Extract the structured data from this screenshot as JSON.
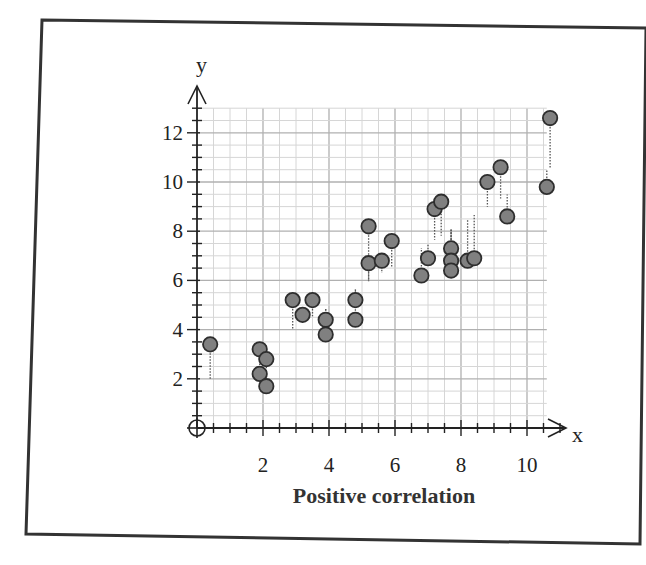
{
  "figure": {
    "caption": "Positive correlation",
    "x_axis_name": "x",
    "y_axis_name": "y"
  },
  "colors": {
    "frame": "#333333",
    "grid_minor": "#d6d6d6",
    "grid_major": "#b0b0b0",
    "axis": "#222222",
    "point_fill": "#808080",
    "point_stroke": "#2e2e2e",
    "residual": "#555555"
  },
  "chart_data": {
    "type": "scatter",
    "title": "Positive correlation",
    "xlabel": "x",
    "ylabel": "y",
    "xlim": [
      0,
      11
    ],
    "ylim": [
      0,
      13
    ],
    "x_ticks": [
      2,
      4,
      6,
      8,
      10
    ],
    "y_ticks": [
      2,
      4,
      6,
      8,
      10,
      12
    ],
    "grid": true,
    "minor_grid_step": 0.5,
    "major_grid_step": 2,
    "legend": null,
    "trend_line": {
      "intercept": 1.6,
      "slope": 0.84,
      "drawn": false,
      "residuals_shown_as_dotted_lines": true
    },
    "points": [
      {
        "x": 0.4,
        "y": 3.4
      },
      {
        "x": 1.9,
        "y": 3.2
      },
      {
        "x": 2.1,
        "y": 2.8
      },
      {
        "x": 1.9,
        "y": 2.2
      },
      {
        "x": 2.1,
        "y": 1.7
      },
      {
        "x": 2.9,
        "y": 5.2
      },
      {
        "x": 3.2,
        "y": 4.6
      },
      {
        "x": 3.5,
        "y": 5.2
      },
      {
        "x": 3.9,
        "y": 4.4
      },
      {
        "x": 3.9,
        "y": 3.8
      },
      {
        "x": 4.8,
        "y": 5.2
      },
      {
        "x": 4.8,
        "y": 4.4
      },
      {
        "x": 5.2,
        "y": 8.2
      },
      {
        "x": 5.2,
        "y": 6.7
      },
      {
        "x": 5.6,
        "y": 6.8
      },
      {
        "x": 5.9,
        "y": 7.6
      },
      {
        "x": 6.8,
        "y": 6.2
      },
      {
        "x": 7.0,
        "y": 6.9
      },
      {
        "x": 7.2,
        "y": 8.9
      },
      {
        "x": 7.4,
        "y": 9.2
      },
      {
        "x": 7.7,
        "y": 7.3
      },
      {
        "x": 7.7,
        "y": 6.8
      },
      {
        "x": 7.7,
        "y": 6.4
      },
      {
        "x": 8.2,
        "y": 6.8
      },
      {
        "x": 8.4,
        "y": 6.9
      },
      {
        "x": 8.8,
        "y": 10.0
      },
      {
        "x": 9.2,
        "y": 10.6
      },
      {
        "x": 9.4,
        "y": 8.6
      },
      {
        "x": 10.6,
        "y": 9.8
      },
      {
        "x": 10.7,
        "y": 12.6
      }
    ]
  }
}
